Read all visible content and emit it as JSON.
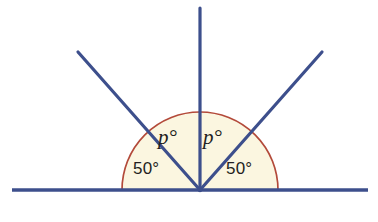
{
  "figure": {
    "type": "geometry-diagram",
    "colors": {
      "ray": "#3d4f8c",
      "arc_stroke": "#b34a3a",
      "sector_fill": "#fbf6e0",
      "label_text": "#231f20",
      "background": "#ffffff"
    },
    "vertex": {
      "x": 200,
      "y": 190
    },
    "baseline": {
      "x1": 12,
      "x2": 368,
      "y": 190
    },
    "arc": {
      "radius": 78,
      "start_deg": 0,
      "end_deg": 180
    },
    "rays": [
      {
        "name": "ray-left-arm",
        "angle_deg": 130,
        "tip_x": 78,
        "tip_y": 52
      },
      {
        "name": "ray-vertical-arm",
        "angle_deg": 90,
        "tip_x": 200,
        "tip_y": 8
      },
      {
        "name": "ray-right-arm",
        "angle_deg": 50,
        "tip_x": 322,
        "tip_y": 52
      }
    ],
    "labels": {
      "p_left": "p°",
      "p_right": "p°",
      "fifty_left": "50°",
      "fifty_right": "50°"
    }
  },
  "chart_data": {
    "type": "diagram",
    "categories": [
      "50°",
      "p°",
      "p°",
      "50°"
    ],
    "values": [
      50,
      40,
      40,
      50
    ],
    "annotations": [
      "50°",
      "p°",
      "p°",
      "50°"
    ],
    "xlabel": "",
    "ylabel": ""
  }
}
